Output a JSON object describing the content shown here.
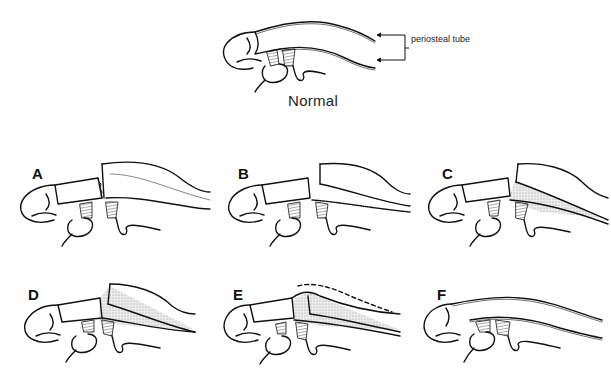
{
  "figure": {
    "normal": {
      "caption": "Normal",
      "annotation": "periosteal tube"
    },
    "panels": [
      {
        "id": "A",
        "label": "A"
      },
      {
        "id": "B",
        "label": "B"
      },
      {
        "id": "C",
        "label": "C"
      },
      {
        "id": "D",
        "label": "D"
      },
      {
        "id": "E",
        "label": "E"
      },
      {
        "id": "F",
        "label": "F"
      }
    ],
    "colors": {
      "line": "#111111",
      "hatch": "#555555",
      "stipple": "#d6d6d6",
      "background": "#ffffff"
    }
  }
}
